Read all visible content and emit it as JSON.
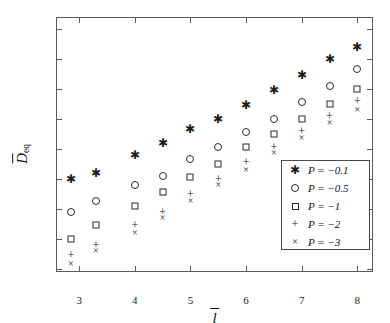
{
  "chart_data": {
    "type": "scatter",
    "title": "",
    "xlabel": "l̄",
    "ylabel": "D̄eq",
    "xlim": [
      2.6,
      8.3
    ],
    "ylim": [
      2.85,
      11.35
    ],
    "xticks": [
      3,
      4,
      5,
      6,
      7,
      8
    ],
    "yticks": [
      3,
      4,
      5,
      6,
      7,
      8,
      9,
      10,
      11
    ],
    "grid": false,
    "legend_position": "lower-right",
    "x": [
      2.85,
      3.3,
      4.0,
      4.5,
      5.0,
      5.5,
      6.0,
      6.5,
      7.0,
      7.5,
      8.0
    ],
    "series": [
      {
        "name": "P = -0.1",
        "marker": "star",
        "values": [
          6.0,
          6.2,
          6.8,
          7.2,
          7.65,
          8.0,
          8.45,
          8.95,
          9.45,
          10.0,
          10.4
        ]
      },
      {
        "name": "P = -0.5",
        "marker": "circle",
        "values": [
          4.9,
          5.25,
          5.8,
          6.1,
          6.65,
          7.05,
          7.55,
          8.0,
          8.55,
          9.1,
          9.65
        ]
      },
      {
        "name": "P = -1",
        "marker": "square",
        "values": [
          4.0,
          4.45,
          5.1,
          5.55,
          6.05,
          6.5,
          7.05,
          7.5,
          8.0,
          8.5,
          9.0
        ]
      },
      {
        "name": "P = -2",
        "marker": "plus",
        "values": [
          3.45,
          3.8,
          4.45,
          4.9,
          5.5,
          6.0,
          6.55,
          7.05,
          7.6,
          8.1,
          8.6
        ]
      },
      {
        "name": "P = -3",
        "marker": "cross",
        "values": [
          3.15,
          3.6,
          4.2,
          4.7,
          5.25,
          5.8,
          6.3,
          6.85,
          7.35,
          7.85,
          8.3
        ]
      }
    ]
  },
  "axes": {
    "ylabel_main": "D",
    "ylabel_sub": "eq",
    "xlabel_main": "l"
  },
  "legend": {
    "entries": [
      {
        "symbol": "star-marker",
        "label": "P = −0.1"
      },
      {
        "symbol": "circle-marker",
        "label": "P = −0.5"
      },
      {
        "symbol": "square-marker",
        "label": "P = −1"
      },
      {
        "symbol": "plus-marker",
        "label": "P = −2"
      },
      {
        "symbol": "cross-marker",
        "label": "P = −3"
      }
    ]
  }
}
